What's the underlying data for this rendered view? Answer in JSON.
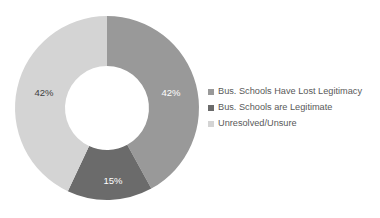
{
  "background_color": "#ffffff",
  "chart_data": {
    "type": "pie",
    "variant": "donut",
    "title": "",
    "subtitle": "",
    "xlabel": "",
    "ylabel": "",
    "grid": false,
    "legend_position": "right",
    "start_angle_deg": 0,
    "direction": "clockwise",
    "center": {
      "x": 107,
      "y": 108
    },
    "outer_radius": 92,
    "inner_radius": 42,
    "categories": [
      "Bus. Schools Have Lost Legitimacy",
      "Bus. Schools are Legitimate",
      "Unresolved/Unsure"
    ],
    "values": [
      42,
      15,
      42
    ],
    "data_labels": [
      "42%",
      "15%",
      "42%"
    ],
    "colors": [
      "#999999",
      "#6b6b6b",
      "#d4d4d4"
    ],
    "label_text_colors": [
      "#ffffff",
      "#ffffff",
      "#3f3f3f"
    ],
    "slices": [
      {
        "name": "Bus. Schools Have Lost Legitimacy",
        "value": 42,
        "label": "42%",
        "color": "#999999",
        "label_color": "#ffffff",
        "start_deg": 0,
        "end_deg": 151.2,
        "label_x": 171,
        "label_y": 93
      },
      {
        "name": "Bus. Schools are Legitimate",
        "value": 15,
        "label": "15%",
        "color": "#6b6b6b",
        "label_color": "#ffffff",
        "start_deg": 151.2,
        "end_deg": 205.2,
        "label_x": 113,
        "label_y": 181
      },
      {
        "name": "Unresolved/Unsure",
        "value": 42,
        "label": "42%",
        "color": "#d4d4d4",
        "label_color": "#3f3f3f",
        "start_deg": 205.2,
        "end_deg": 360,
        "label_x": 44,
        "label_y": 93
      }
    ]
  },
  "legend": {
    "items": [
      {
        "label": "Bus. Schools Have Lost Legitimacy",
        "color": "#999999"
      },
      {
        "label": "Bus. Schools are Legitimate",
        "color": "#6b6b6b"
      },
      {
        "label": "Unresolved/Unsure",
        "color": "#d4d4d4"
      }
    ]
  }
}
